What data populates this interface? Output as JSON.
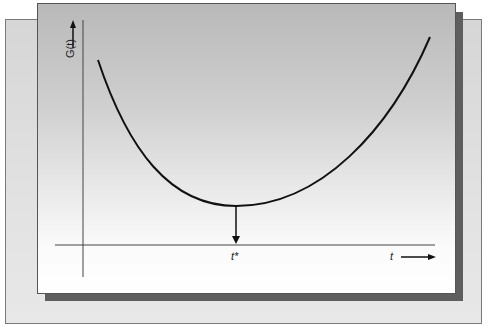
{
  "diagram": {
    "y_axis_label": "G(t)",
    "x_axis_label": "t",
    "optimum_label": "t*",
    "curve_description": "U-shaped cost curve G(t) with a minimum at t*",
    "colors": {
      "curve": "#111111",
      "axes": "#444444",
      "front_panel_top": "#b9b9b9",
      "front_panel_bottom": "#ffffff",
      "shadow": "#5e5e5e",
      "back_panel": "#dcdcdc"
    }
  }
}
